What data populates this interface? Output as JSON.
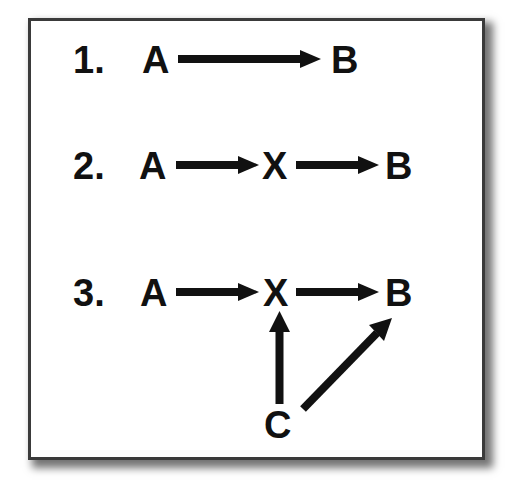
{
  "diagram": {
    "type": "causal-path-diagram",
    "rows": [
      {
        "number": "1.",
        "nodes": [
          "A",
          "B"
        ],
        "edges": [
          {
            "from": "A",
            "to": "B"
          }
        ]
      },
      {
        "number": "2.",
        "nodes": [
          "A",
          "X",
          "B"
        ],
        "edges": [
          {
            "from": "A",
            "to": "X"
          },
          {
            "from": "X",
            "to": "B"
          }
        ]
      },
      {
        "number": "3.",
        "nodes": [
          "A",
          "X",
          "B",
          "C"
        ],
        "edges": [
          {
            "from": "A",
            "to": "X"
          },
          {
            "from": "X",
            "to": "B"
          },
          {
            "from": "C",
            "to": "X"
          },
          {
            "from": "C",
            "to": "B"
          }
        ]
      }
    ]
  },
  "row1": {
    "number": "1.",
    "a": "A",
    "b": "B"
  },
  "row2": {
    "number": "2.",
    "a": "A",
    "x": "X",
    "b": "B"
  },
  "row3": {
    "number": "3.",
    "a": "A",
    "x": "X",
    "b": "B",
    "c": "C"
  },
  "colors": {
    "ink": "#111111",
    "border": "#3a3a3a",
    "background": "#ffffff"
  }
}
